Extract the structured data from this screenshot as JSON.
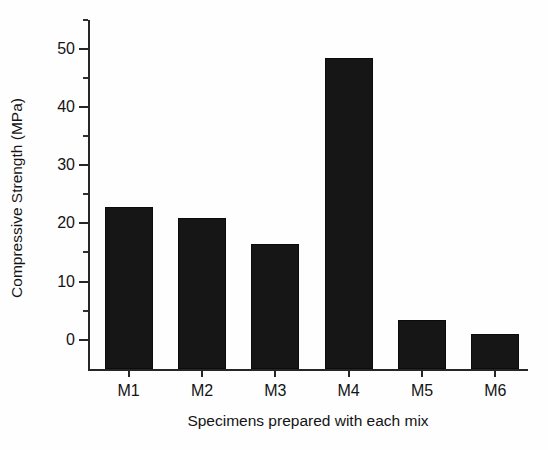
{
  "chart_data": {
    "type": "bar",
    "title": "",
    "categories": [
      "M1",
      "M2",
      "M3",
      "M4",
      "M5",
      "M6"
    ],
    "values": [
      22.5,
      20.6,
      16.1,
      48.1,
      3.1,
      0.6
    ],
    "xlabel": "Specimens prepared with each mix",
    "ylabel": "Compressive Strength (MPa)",
    "ylim": [
      -5.4,
      55.0
    ],
    "yticks": [
      0,
      10,
      20,
      30,
      40,
      50
    ],
    "ytick_labels": [
      "0",
      "10",
      "20",
      "30",
      "40",
      "50"
    ],
    "yminor_ticks": [
      5,
      15,
      25,
      35,
      45,
      55
    ],
    "grid": false,
    "legend": null,
    "bar_color": "#161616",
    "axis_color": "#262626",
    "background": "#ffffff"
  }
}
